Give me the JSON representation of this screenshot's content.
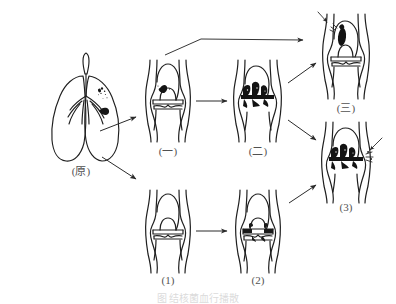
{
  "figure": {
    "type": "medical-illustration",
    "caption": "图  结核菌血行播散",
    "background_color": "#ffffff",
    "ink_color": "#1a1a1a",
    "lesion_color": "#111111"
  },
  "panels": [
    {
      "id": "origin",
      "label": "(原)",
      "organ": "lungs",
      "label_x": 81,
      "label_y": 168,
      "description": "bilateral lungs with bronchial tree and dark tubercular focus in right upper lobe"
    },
    {
      "id": "upper-1",
      "label": "(一)",
      "organ": "knee-joint",
      "label_x": 168,
      "label_y": 148,
      "description": "knee joint with small dark focus in medial femoral condyle, joint space intact"
    },
    {
      "id": "upper-2",
      "label": "(二)",
      "organ": "knee-joint",
      "label_x": 258,
      "label_y": 148,
      "description": "knee joint with extensive dark destruction across the joint space"
    },
    {
      "id": "upper-3",
      "label": "(三)",
      "organ": "knee-joint",
      "label_x": 346,
      "label_y": 105,
      "description": "knee joint with dark oval focus in distal femur, arrow marker at upper left"
    },
    {
      "id": "lower-1",
      "label": "(1)",
      "organ": "knee-joint",
      "label_x": 168,
      "label_y": 280,
      "description": "knee joint with clear intact joint space, no lesion"
    },
    {
      "id": "lower-2",
      "label": "(2)",
      "organ": "knee-joint",
      "label_x": 258,
      "label_y": 280,
      "description": "knee joint with narrowed irregular joint space and early erosion"
    },
    {
      "id": "lower-3",
      "label": "(3)",
      "organ": "knee-joint",
      "label_x": 346,
      "label_y": 207,
      "description": "knee joint with dense dark destruction of joint space, arrow marker at right"
    }
  ],
  "arrows": [
    {
      "id": "lung-to-upper1",
      "from": "origin",
      "to": "upper-1"
    },
    {
      "id": "lung-to-lower1",
      "from": "origin",
      "to": "lower-1"
    },
    {
      "id": "upper1-to-upper2",
      "from": "upper-1",
      "to": "upper-2"
    },
    {
      "id": "upper2-to-upper3",
      "from": "upper-2",
      "to": "upper-3"
    },
    {
      "id": "bent-to-upper3",
      "from": "origin-path",
      "to": "upper-3"
    },
    {
      "id": "lower1-to-lower2",
      "from": "lower-1",
      "to": "lower-2"
    },
    {
      "id": "lower2-to-lower3",
      "from": "lower-2",
      "to": "lower-3"
    },
    {
      "id": "upper2-to-lower3",
      "from": "upper-2",
      "to": "lower-3"
    }
  ]
}
